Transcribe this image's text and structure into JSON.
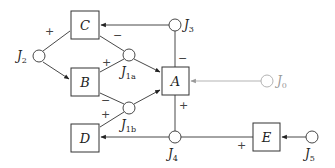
{
  "diagram": {
    "type": "block-diagram",
    "blocks": [
      {
        "id": "C",
        "label": "C"
      },
      {
        "id": "B",
        "label": "B"
      },
      {
        "id": "A",
        "label": "A"
      },
      {
        "id": "D",
        "label": "D"
      },
      {
        "id": "E",
        "label": "E"
      }
    ],
    "junctions": [
      {
        "id": "J0",
        "label": "J",
        "sub": "0",
        "style": "gray"
      },
      {
        "id": "J1a",
        "label": "J",
        "sub": "1a"
      },
      {
        "id": "J1b",
        "label": "J",
        "sub": "1b"
      },
      {
        "id": "J2",
        "label": "J",
        "sub": "2"
      },
      {
        "id": "J3",
        "label": "J",
        "sub": "3"
      },
      {
        "id": "J4",
        "label": "J",
        "sub": "4"
      },
      {
        "id": "J5",
        "label": "J",
        "sub": "5"
      }
    ],
    "signs": {
      "j2_c": "+",
      "c_j1a": "−",
      "b_j1a": "+",
      "j3_a": "−",
      "b_j1b": "−",
      "d_j1b": "+",
      "a_j4": "+",
      "e_j4": "+"
    },
    "edges": [
      {
        "from": "J3",
        "to": "C",
        "arrow": true
      },
      {
        "from": "J3",
        "to": "A",
        "sign": "−"
      },
      {
        "from": "J2",
        "to": "C",
        "sign": "+"
      },
      {
        "from": "J2",
        "to": "B",
        "arrow": true
      },
      {
        "from": "C",
        "to": "J1a",
        "sign": "−"
      },
      {
        "from": "B",
        "to": "J1a",
        "sign": "+"
      },
      {
        "from": "J1a",
        "to": "A",
        "arrow": true
      },
      {
        "from": "B",
        "to": "J1b",
        "sign": "−"
      },
      {
        "from": "D",
        "to": "J1b",
        "sign": "+"
      },
      {
        "from": "J1b",
        "to": "A",
        "arrow": true
      },
      {
        "from": "J0",
        "to": "A",
        "arrow": true,
        "style": "gray"
      },
      {
        "from": "A",
        "to": "J4",
        "sign": "+"
      },
      {
        "from": "J4",
        "to": "D",
        "arrow": true
      },
      {
        "from": "E",
        "to": "J4",
        "sign": "+"
      },
      {
        "from": "J5",
        "to": "E",
        "arrow": true
      }
    ]
  }
}
